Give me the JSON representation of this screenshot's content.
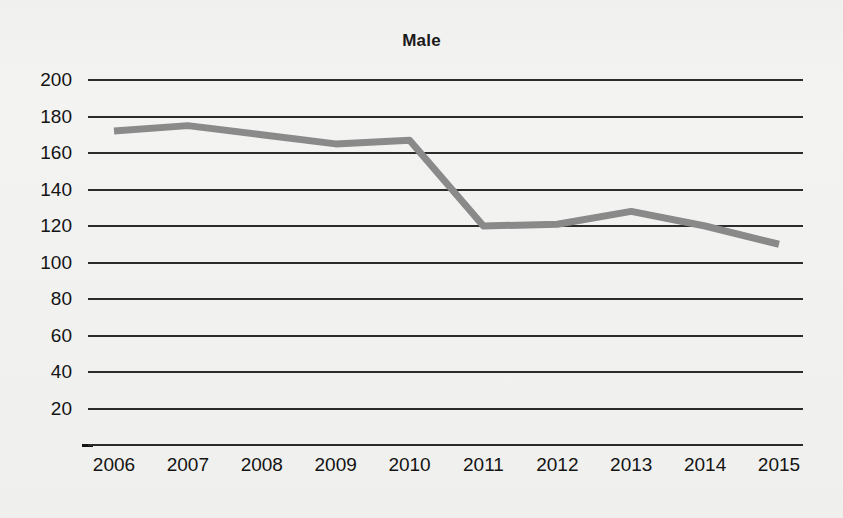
{
  "chart_data": {
    "type": "line",
    "title": "Male",
    "xlabel": "",
    "ylabel": "",
    "categories": [
      "2006",
      "2007",
      "2008",
      "2009",
      "2010",
      "2011",
      "2012",
      "2013",
      "2014",
      "2015"
    ],
    "series": [
      {
        "name": "Male",
        "color": "#8a8a8a",
        "values": [
          172,
          175,
          170,
          165,
          167,
          120,
          121,
          128,
          120,
          110
        ]
      }
    ],
    "ylim": [
      0,
      200
    ],
    "yticks": [
      200,
      180,
      160,
      140,
      120,
      100,
      80,
      60,
      40,
      20,
      0
    ],
    "ytick_labels": [
      "200",
      "180",
      "160",
      "140",
      "120",
      "100",
      "80",
      "60",
      "40",
      "20",
      "–"
    ],
    "grid": true,
    "grid_color": "#2b2b2b",
    "legend": "none",
    "background_color": "#f3f3f1",
    "text_color": "#141414"
  }
}
